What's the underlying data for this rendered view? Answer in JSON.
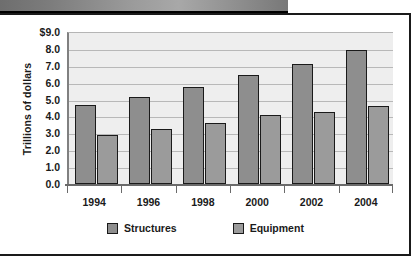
{
  "chart_data": {
    "type": "bar",
    "title": "",
    "subtitle": "",
    "xlabel": "",
    "ylabel": "Trillions of dollars",
    "categories": [
      "1994",
      "1996",
      "1998",
      "2000",
      "2002",
      "2004"
    ],
    "series": [
      {
        "name": "Structures",
        "color": "#8e8e8e",
        "values": [
          4.7,
          5.15,
          5.75,
          6.45,
          7.1,
          7.95
        ]
      },
      {
        "name": "Equipment",
        "color": "#9b9b9b",
        "values": [
          2.9,
          3.25,
          3.6,
          4.1,
          4.25,
          4.6
        ]
      }
    ],
    "ylim": [
      0.0,
      9.0
    ],
    "ytick_values": [
      9.0,
      8.0,
      7.0,
      6.0,
      5.0,
      4.0,
      3.0,
      2.0,
      1.0,
      0.0
    ],
    "ytick_labels": [
      "$9.0",
      "8.0",
      "7.0",
      "6.0",
      "5.0",
      "4.0",
      "3.0",
      "2.0",
      "1.0",
      "0.0"
    ],
    "grid": true,
    "grid_axis": "y",
    "legend_position": "bottom",
    "plot_background": "#eeeeee"
  },
  "figure": {
    "banner_present": true
  }
}
